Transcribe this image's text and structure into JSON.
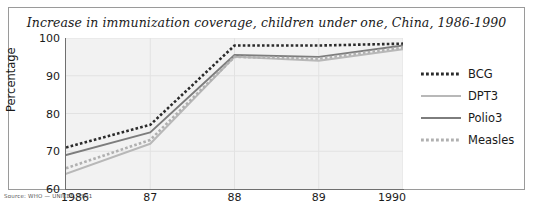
{
  "chart_data": {
    "type": "line",
    "title": "Increase in immunization coverage, children under one, China, 1986-1990",
    "xlabel": "",
    "ylabel": "Percentage",
    "categories": [
      "1986",
      "87",
      "88",
      "89",
      "1990"
    ],
    "x_tick_labels": [
      "1986",
      "87",
      "88",
      "89",
      "1990"
    ],
    "y_tick_labels": [
      "60",
      "70",
      "80",
      "90",
      "100"
    ],
    "ylim": [
      60,
      100
    ],
    "y_step": 10,
    "grid": true,
    "legend_position": "right",
    "series": [
      {
        "name": "BCG",
        "values": [
          71,
          77,
          98,
          98,
          98.5
        ],
        "style": "dotted",
        "color": "#2b2b2b"
      },
      {
        "name": "DPT3",
        "values": [
          64,
          72,
          95,
          94,
          97
        ],
        "style": "solid",
        "color": "#b8b8b8"
      },
      {
        "name": "Polio3",
        "values": [
          69,
          75,
          95.5,
          95,
          98
        ],
        "style": "solid",
        "color": "#7d7d7d"
      },
      {
        "name": "Measles",
        "values": [
          65.5,
          73,
          95,
          94.5,
          97.5
        ],
        "style": "dotted",
        "color": "#b0b0b0"
      }
    ]
  },
  "figure": {
    "source_note": "Source: WHO — UNICEF, 1991",
    "plot_background": "#f2f2f2",
    "border_color": "#9a9a9a",
    "grid_color": "#e2e2e2",
    "axis_color": "#6f6f6f"
  }
}
